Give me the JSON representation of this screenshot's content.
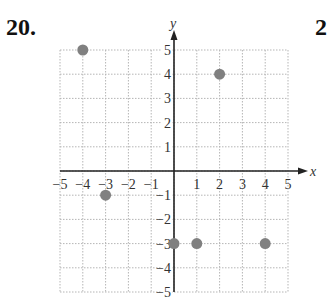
{
  "problem_number": "20.",
  "next_problem_partial": "2",
  "chart_data": {
    "type": "scatter",
    "title": "",
    "xlabel": "x",
    "ylabel": "y",
    "xlim": [
      -5,
      5
    ],
    "ylim": [
      -5,
      5
    ],
    "grid": true,
    "x_ticks": [
      -5,
      -4,
      -3,
      -2,
      -1,
      1,
      2,
      3,
      4,
      5
    ],
    "y_ticks": [
      -5,
      -4,
      -3,
      -2,
      -1,
      1,
      2,
      3,
      4,
      5
    ],
    "points": [
      {
        "x": -4,
        "y": 5
      },
      {
        "x": 2,
        "y": 4
      },
      {
        "x": -3,
        "y": -1
      },
      {
        "x": 0,
        "y": -3
      },
      {
        "x": 1,
        "y": -3
      },
      {
        "x": 4,
        "y": -3
      }
    ],
    "point_color": "#808080"
  }
}
